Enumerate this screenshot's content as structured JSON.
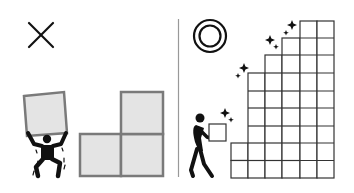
{
  "illustration": {
    "left_panel": {
      "verdict": "incorrect",
      "verdict_icon": "cross-mark-icon",
      "scene": "person straining to lift one large box, next to an L-shaped stack of three large boxes"
    },
    "right_panel": {
      "verdict": "correct",
      "verdict_icon": "double-circle-icon",
      "scene": "person easily carrying one small box beside a staircase of many small stacked boxes with sparkles"
    },
    "colors": {
      "ink": "#111111",
      "large_box_fill": "#e4e4e4",
      "large_box_stroke": "#7a7a7a",
      "small_grid_stroke": "#333333",
      "divider": "#999999",
      "background": "#ffffff"
    },
    "staircase": {
      "columns_top_rows": [
        2,
        6,
        7,
        8,
        9,
        9
      ],
      "cell_size": 17.3
    }
  }
}
